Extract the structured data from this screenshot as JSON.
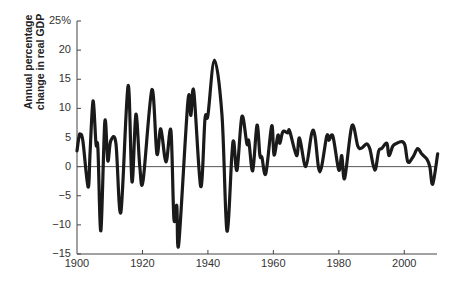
{
  "chart_data": {
    "type": "line",
    "title": "",
    "xlabel": "",
    "ylabel": "Annual percentage change in real GDP",
    "ylabel_lines": [
      "Annual percentage",
      "change in real GDP"
    ],
    "xlim": [
      1900,
      2010
    ],
    "ylim": [
      -15,
      25
    ],
    "x_ticks": [
      1900,
      1920,
      1940,
      1960,
      1980,
      2000
    ],
    "x_tick_labels": [
      "1900",
      "1920",
      "1940",
      "1960",
      "1980",
      "2000"
    ],
    "y_ticks": [
      -15,
      -10,
      -5,
      0,
      5,
      10,
      15,
      20,
      25
    ],
    "y_tick_labels": [
      "−15",
      "−10",
      "−5",
      "0",
      "5",
      "10",
      "15",
      "20",
      "25%"
    ],
    "grid": false,
    "zero_line": true,
    "legend": null,
    "line_color": "#1a1a1a",
    "series": [
      {
        "name": "Annual percentage change in real GDP",
        "x": [
          1900,
          1900.6,
          1901,
          1901.8,
          1903.4,
          1904.0,
          1904.9,
          1905.8,
          1906.4,
          1907.3,
          1908.5,
          1909.4,
          1910.3,
          1911.9,
          1913.4,
          1915.6,
          1916.8,
          1918.0,
          1919.2,
          1920.2,
          1922.9,
          1924.4,
          1925.6,
          1927.2,
          1928.7,
          1929.6,
          1930.5,
          1931.1,
          1933.9,
          1934.8,
          1935.7,
          1937.8,
          1939.1,
          1940.0,
          1942.0,
          1944.3,
          1945.8,
          1947.3,
          1947.9,
          1948.9,
          1950.4,
          1951.9,
          1952.5,
          1953.7,
          1955.0,
          1955.9,
          1956.5,
          1957.7,
          1959.5,
          1960.2,
          1961.4,
          1962.0,
          1962.9,
          1964.4,
          1965.0,
          1967.1,
          1968.0,
          1969.9,
          1971.7,
          1972.7,
          1974.2,
          1976.3,
          1977.0,
          1978.2,
          1980.0,
          1980.9,
          1981.8,
          1984.0,
          1985.8,
          1987.0,
          1988.5,
          1989.5,
          1991.0,
          1992.2,
          1993.1,
          1994.7,
          1995.3,
          1996.5,
          1997.7,
          1999.2,
          2000.2,
          2001.1,
          2002.6,
          2004.1,
          2005.3,
          2006.9,
          2007.8,
          2008.7,
          2010.2
        ],
        "values": [
          2.7,
          5.1,
          5.6,
          4.4,
          -3.5,
          2.5,
          11.3,
          3.9,
          3.1,
          -11.0,
          7.7,
          1.0,
          4.4,
          4.0,
          -7.8,
          13.9,
          -2.6,
          9.0,
          0.0,
          -2.4,
          13.2,
          2.2,
          6.5,
          0.8,
          6.2,
          -8.9,
          -6.7,
          -13.2,
          11.2,
          8.8,
          12.9,
          -3.4,
          8.2,
          8.8,
          18.3,
          8.8,
          -11.0,
          1.8,
          4.3,
          -0.6,
          8.6,
          3.9,
          4.4,
          -0.7,
          7.1,
          1.9,
          1.6,
          -1.2,
          7.0,
          2.0,
          5.4,
          4.0,
          6.0,
          5.8,
          6.1,
          1.9,
          4.9,
          0.0,
          5.7,
          5.3,
          -0.9,
          5.2,
          4.5,
          5.2,
          -0.6,
          1.9,
          -2.0,
          7.0,
          3.5,
          3.2,
          3.9,
          3.0,
          -0.6,
          2.7,
          3.1,
          4.0,
          1.9,
          3.5,
          4.0,
          4.3,
          3.7,
          0.8,
          1.6,
          3.1,
          2.2,
          1.3,
          0.0,
          -3.0,
          2.2
        ]
      }
    ]
  }
}
